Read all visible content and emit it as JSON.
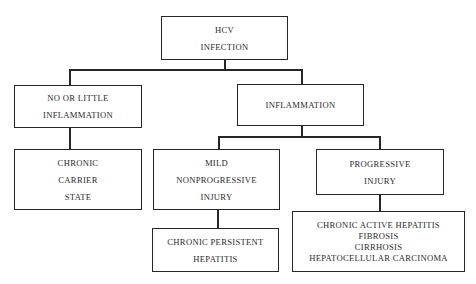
{
  "diagram": {
    "type": "tree",
    "nodes": {
      "root": {
        "id": "hcv-infection",
        "lines": [
          "HCV",
          "INFECTION"
        ]
      },
      "no_inflammation": {
        "id": "no-or-little-inflammation",
        "lines": [
          "NO OR LITTLE",
          "INFLAMMATION"
        ]
      },
      "inflammation": {
        "id": "inflammation",
        "lines": [
          "INFLAMMATION"
        ]
      },
      "carrier": {
        "id": "chronic-carrier-state",
        "lines": [
          "CHRONIC",
          "CARRIER",
          "STATE"
        ]
      },
      "mild": {
        "id": "mild-nonprogressive-injury",
        "lines": [
          "MILD",
          "NONPROGRESSIVE",
          "INJURY"
        ]
      },
      "progressive": {
        "id": "progressive-injury",
        "lines": [
          "PROGRESSIVE",
          "INJURY"
        ]
      },
      "persistent": {
        "id": "chronic-persistent-hepatitis",
        "lines": [
          "CHRONIC PERSISTENT",
          "HEPATITIS"
        ]
      },
      "outcomes": {
        "id": "progressive-outcomes",
        "lines": [
          "CHRONIC ACTIVE HEPATITIS",
          "FIBROSIS",
          "CIRRHOSIS",
          "HEPATOCELLULAR CARCINOMA"
        ]
      }
    },
    "edges": [
      [
        "hcv-infection",
        "no-or-little-inflammation"
      ],
      [
        "hcv-infection",
        "inflammation"
      ],
      [
        "no-or-little-inflammation",
        "chronic-carrier-state"
      ],
      [
        "inflammation",
        "mild-nonprogressive-injury"
      ],
      [
        "inflammation",
        "progressive-injury"
      ],
      [
        "mild-nonprogressive-injury",
        "chronic-persistent-hepatitis"
      ],
      [
        "progressive-injury",
        "progressive-outcomes"
      ]
    ]
  }
}
